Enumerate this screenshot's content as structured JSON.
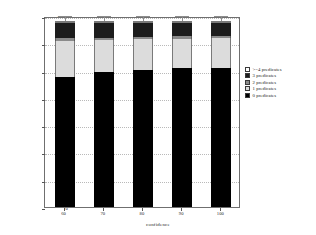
{
  "chart_data": {
    "type": "bar",
    "stacked": true,
    "title": "",
    "xlabel": "confidence",
    "ylabel": "Number of functions",
    "categories": [
      "60",
      "70",
      "80",
      "90",
      "100"
    ],
    "ylim": [
      0,
      1400
    ],
    "yticks": [
      "0",
      "200",
      "400",
      "600",
      "800",
      "1,000",
      "1,200",
      "1,400"
    ],
    "ytick_values": [
      0,
      200,
      400,
      600,
      800,
      1000,
      1200,
      1400
    ],
    "grid": true,
    "legend_position": "right",
    "series": [
      {
        "name": "0 predicates",
        "values": [
          950,
          990,
          1005,
          1020,
          1020
        ]
      },
      {
        "name": "1 predicates",
        "values": [
          270,
          235,
          225,
          215,
          220
        ]
      },
      {
        "name": "2 predicates",
        "values": [
          18,
          16,
          16,
          15,
          15
        ]
      },
      {
        "name": "3 predicates",
        "values": [
          112,
          109,
          104,
          100,
          95
        ]
      },
      {
        "name": ">=4 predicates",
        "values": [
          10,
          10,
          10,
          10,
          10
        ]
      }
    ],
    "totals": [
      1360,
      1360,
      1360,
      1360,
      1360
    ],
    "colors": {
      "0 predicates": "#000000",
      "1 predicates": "#dcdcdc",
      "2 predicates": "#8a8a8a",
      "3 predicates": "#1c1c1c",
      ">=4 predicates": "#ffffff"
    }
  },
  "legend": {
    "items": [
      {
        "label": ">=4 predicates",
        "swatch": "white-swatch"
      },
      {
        "label": "3 predicates",
        "swatch": "black-swatch"
      },
      {
        "label": "2 predicates",
        "swatch": "dark-gray-swatch"
      },
      {
        "label": "1 predicates",
        "swatch": "light-gray-swatch"
      },
      {
        "label": "0 predicates",
        "swatch": "black-swatch"
      }
    ]
  },
  "axes": {
    "y_label": "Number of functions",
    "x_label": "confidence",
    "y_ticks": [
      "1,400",
      "1,200",
      "1,000",
      "800",
      "600",
      "400",
      "200",
      "0"
    ],
    "x_ticks": [
      "60",
      "70",
      "80",
      "90",
      "100"
    ]
  }
}
